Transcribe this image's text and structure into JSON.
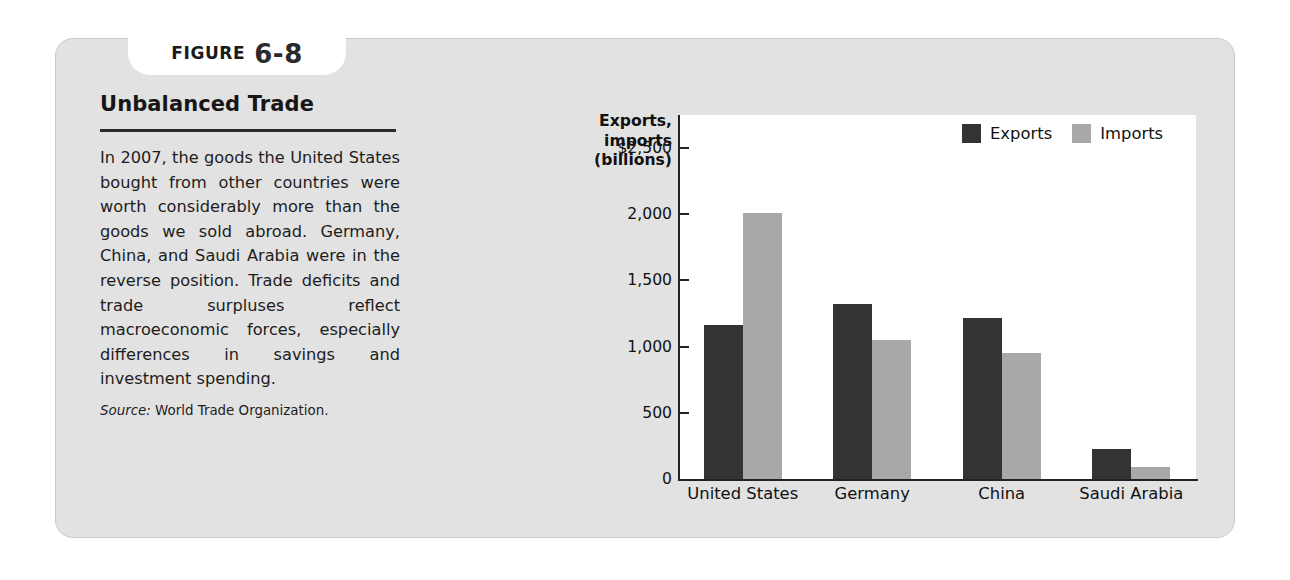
{
  "figure": {
    "tab_word": "FIGURE",
    "tab_number": "6-8",
    "heading": "Unbalanced Trade",
    "body": "In 2007, the goods the United States bought from other countries were worth considerably more than the goods we sold abroad. Germany, China, and Saudi Arabia were in the reverse position. Trade deficits and trade surpluses reflect macroeconomic forces, especially differences in savings and investment spending.",
    "source_label": "Source:",
    "source_text": "World Trade Organization."
  },
  "colors": {
    "card_background": "#e2e2e2",
    "exports": "#333333",
    "imports": "#a8a8a8",
    "axis": "#222222",
    "plot_background": "#ffffff"
  },
  "chart_data": {
    "type": "bar",
    "title": "",
    "ylabel": "Exports, imports (billions)",
    "ylabel_lines": [
      "Exports,",
      "imports",
      "(billions)"
    ],
    "xlabel": "",
    "categories": [
      "United States",
      "Germany",
      "China",
      "Saudi Arabia"
    ],
    "series": [
      {
        "name": "Exports",
        "values": [
          1160,
          1320,
          1220,
          230
        ]
      },
      {
        "name": "Imports",
        "values": [
          2010,
          1050,
          950,
          90
        ]
      }
    ],
    "ylim": [
      0,
      2750
    ],
    "yticks": [
      0,
      500,
      1000,
      1500,
      2000,
      2500
    ],
    "ytick_labels": [
      "0",
      "500",
      "1,000",
      "1,500",
      "2,000",
      "$2,500"
    ],
    "grid": false,
    "legend": [
      "Exports",
      "Imports"
    ],
    "legend_position": "top-right"
  }
}
